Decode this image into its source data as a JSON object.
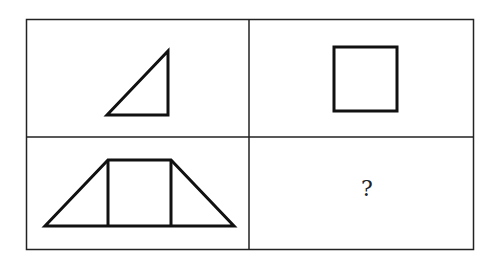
{
  "puzzle": {
    "type": "figure-analogy-grid",
    "rows": 2,
    "cols": 2,
    "cells": [
      {
        "row": 0,
        "col": 0,
        "content": "right-triangle"
      },
      {
        "row": 0,
        "col": 1,
        "content": "square"
      },
      {
        "row": 1,
        "col": 0,
        "content": "trapezoid composed of two right triangles and a square"
      },
      {
        "row": 1,
        "col": 1,
        "content": "unknown",
        "label": "?"
      }
    ],
    "colors": {
      "stroke": "#111111",
      "background": "#ffffff"
    }
  }
}
